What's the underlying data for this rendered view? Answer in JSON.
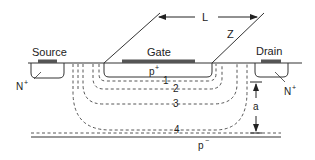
{
  "diagram": {
    "labels": {
      "source": "Source",
      "gate": "Gate",
      "drain": "Drain",
      "length": "L",
      "width": "Z",
      "p_plus": "p",
      "p_plus_sup": "+",
      "n_plus_left": "N",
      "n_plus_left_sup": "+",
      "n_plus_right": "N",
      "n_plus_right_sup": "+",
      "depth": "a",
      "substrate": "p",
      "substrate_sup": "−"
    },
    "contours": [
      {
        "id": 1,
        "label": "1"
      },
      {
        "id": 2,
        "label": "2"
      },
      {
        "id": 3,
        "label": "3"
      },
      {
        "id": 4,
        "label": "4"
      }
    ],
    "colors": {
      "line": "#333333",
      "contact": "#555555",
      "background": "#ffffff"
    }
  }
}
